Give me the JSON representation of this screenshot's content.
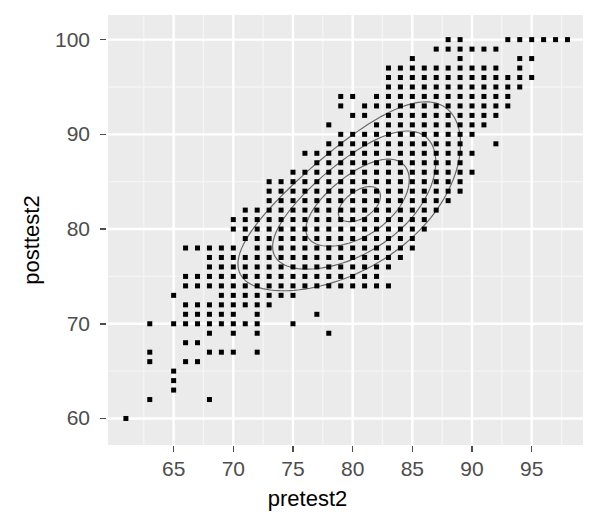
{
  "chart_data": {
    "type": "scatter",
    "title": "",
    "subtitle": "",
    "xlabel": "pretest2",
    "ylabel": "posttest2",
    "xlim": [
      59.5,
      99.3
    ],
    "ylim": [
      57.2,
      102.6
    ],
    "xticks": [
      65,
      70,
      75,
      80,
      85,
      90,
      95
    ],
    "yticks": [
      60,
      70,
      80,
      90,
      100
    ],
    "grid": true,
    "legend": null,
    "theme": "ggplot2-gray",
    "colors": {
      "panel_background": "#ebebeb",
      "grid_major": "#ffffff",
      "grid_minor": "#f5f5f5",
      "point_fill": "#000000",
      "contour_line": "#666666",
      "axis_text": "#4d4d4d",
      "axis_title": "#000000",
      "figure_background": "#ffffff"
    },
    "point_marker": {
      "shape": "square",
      "size_px": 5
    },
    "annotations": [],
    "overlays": [
      {
        "name": "density-2d-contours",
        "type": "contour",
        "levels": 4,
        "color": "#666666",
        "description": "Nested elongated elliptical 2D kernel-density contours oriented along the positive diagonal, centred near (80.5, 82.5)."
      }
    ],
    "points": [
      [
        61,
        60
      ],
      [
        63,
        62
      ],
      [
        63,
        66
      ],
      [
        63,
        67
      ],
      [
        63,
        70
      ],
      [
        65,
        63
      ],
      [
        65,
        64
      ],
      [
        65,
        65
      ],
      [
        65,
        70
      ],
      [
        65,
        73
      ],
      [
        66,
        66
      ],
      [
        66,
        68
      ],
      [
        66,
        70
      ],
      [
        66,
        71
      ],
      [
        66,
        72
      ],
      [
        66,
        74
      ],
      [
        66,
        75
      ],
      [
        66,
        78
      ],
      [
        67,
        66
      ],
      [
        67,
        68
      ],
      [
        67,
        70
      ],
      [
        67,
        71
      ],
      [
        67,
        72
      ],
      [
        67,
        74
      ],
      [
        67,
        75
      ],
      [
        67,
        78
      ],
      [
        68,
        62
      ],
      [
        68,
        67
      ],
      [
        68,
        69
      ],
      [
        68,
        70
      ],
      [
        68,
        71
      ],
      [
        68,
        72
      ],
      [
        68,
        74
      ],
      [
        68,
        75
      ],
      [
        68,
        76
      ],
      [
        68,
        77
      ],
      [
        68,
        78
      ],
      [
        69,
        67
      ],
      [
        69,
        70
      ],
      [
        69,
        71
      ],
      [
        69,
        72
      ],
      [
        69,
        73
      ],
      [
        69,
        74
      ],
      [
        69,
        75
      ],
      [
        69,
        76
      ],
      [
        69,
        77
      ],
      [
        69,
        78
      ],
      [
        70,
        67
      ],
      [
        70,
        69
      ],
      [
        70,
        70
      ],
      [
        70,
        71
      ],
      [
        70,
        72
      ],
      [
        70,
        73
      ],
      [
        70,
        74
      ],
      [
        70,
        75
      ],
      [
        70,
        76
      ],
      [
        70,
        77
      ],
      [
        70,
        78
      ],
      [
        70,
        80
      ],
      [
        70,
        81
      ],
      [
        71,
        70
      ],
      [
        71,
        72
      ],
      [
        71,
        73
      ],
      [
        71,
        74
      ],
      [
        71,
        75
      ],
      [
        71,
        76
      ],
      [
        71,
        77
      ],
      [
        71,
        79
      ],
      [
        71,
        80
      ],
      [
        71,
        81
      ],
      [
        71,
        82
      ],
      [
        72,
        67
      ],
      [
        72,
        69
      ],
      [
        72,
        70
      ],
      [
        72,
        71
      ],
      [
        72,
        72
      ],
      [
        72,
        73
      ],
      [
        72,
        74
      ],
      [
        72,
        75
      ],
      [
        72,
        76
      ],
      [
        72,
        77
      ],
      [
        72,
        78
      ],
      [
        72,
        79
      ],
      [
        72,
        80
      ],
      [
        72,
        81
      ],
      [
        72,
        82
      ],
      [
        73,
        72
      ],
      [
        73,
        73
      ],
      [
        73,
        74
      ],
      [
        73,
        75
      ],
      [
        73,
        76
      ],
      [
        73,
        77
      ],
      [
        73,
        78
      ],
      [
        73,
        79
      ],
      [
        73,
        80
      ],
      [
        73,
        81
      ],
      [
        73,
        82
      ],
      [
        73,
        83
      ],
      [
        73,
        84
      ],
      [
        73,
        85
      ],
      [
        74,
        73
      ],
      [
        74,
        74
      ],
      [
        74,
        75
      ],
      [
        74,
        76
      ],
      [
        74,
        77
      ],
      [
        74,
        78
      ],
      [
        74,
        79
      ],
      [
        74,
        80
      ],
      [
        74,
        81
      ],
      [
        74,
        82
      ],
      [
        74,
        83
      ],
      [
        74,
        84
      ],
      [
        74,
        85
      ],
      [
        75,
        70
      ],
      [
        75,
        73
      ],
      [
        75,
        74
      ],
      [
        75,
        75
      ],
      [
        75,
        76
      ],
      [
        75,
        77
      ],
      [
        75,
        78
      ],
      [
        75,
        79
      ],
      [
        75,
        80
      ],
      [
        75,
        81
      ],
      [
        75,
        82
      ],
      [
        75,
        83
      ],
      [
        75,
        84
      ],
      [
        75,
        85
      ],
      [
        75,
        86
      ],
      [
        76,
        74
      ],
      [
        76,
        75
      ],
      [
        76,
        76
      ],
      [
        76,
        77
      ],
      [
        76,
        78
      ],
      [
        76,
        79
      ],
      [
        76,
        80
      ],
      [
        76,
        81
      ],
      [
        76,
        82
      ],
      [
        76,
        83
      ],
      [
        76,
        84
      ],
      [
        76,
        85
      ],
      [
        76,
        86
      ],
      [
        76,
        88
      ],
      [
        77,
        71
      ],
      [
        77,
        74
      ],
      [
        77,
        75
      ],
      [
        77,
        76
      ],
      [
        77,
        77
      ],
      [
        77,
        78
      ],
      [
        77,
        79
      ],
      [
        77,
        80
      ],
      [
        77,
        81
      ],
      [
        77,
        82
      ],
      [
        77,
        83
      ],
      [
        77,
        84
      ],
      [
        77,
        85
      ],
      [
        77,
        86
      ],
      [
        77,
        87
      ],
      [
        77,
        88
      ],
      [
        78,
        69
      ],
      [
        78,
        74
      ],
      [
        78,
        75
      ],
      [
        78,
        76
      ],
      [
        78,
        77
      ],
      [
        78,
        78
      ],
      [
        78,
        79
      ],
      [
        78,
        80
      ],
      [
        78,
        81
      ],
      [
        78,
        82
      ],
      [
        78,
        83
      ],
      [
        78,
        84
      ],
      [
        78,
        85
      ],
      [
        78,
        86
      ],
      [
        78,
        87
      ],
      [
        78,
        88
      ],
      [
        78,
        89
      ],
      [
        78,
        91
      ],
      [
        79,
        74
      ],
      [
        79,
        75
      ],
      [
        79,
        76
      ],
      [
        79,
        77
      ],
      [
        79,
        78
      ],
      [
        79,
        79
      ],
      [
        79,
        80
      ],
      [
        79,
        81
      ],
      [
        79,
        82
      ],
      [
        79,
        83
      ],
      [
        79,
        84
      ],
      [
        79,
        85
      ],
      [
        79,
        86
      ],
      [
        79,
        87
      ],
      [
        79,
        88
      ],
      [
        79,
        89
      ],
      [
        79,
        90
      ],
      [
        79,
        93
      ],
      [
        79,
        94
      ],
      [
        80,
        74
      ],
      [
        80,
        75
      ],
      [
        80,
        76
      ],
      [
        80,
        77
      ],
      [
        80,
        78
      ],
      [
        80,
        79
      ],
      [
        80,
        80
      ],
      [
        80,
        81
      ],
      [
        80,
        82
      ],
      [
        80,
        83
      ],
      [
        80,
        84
      ],
      [
        80,
        85
      ],
      [
        80,
        86
      ],
      [
        80,
        87
      ],
      [
        80,
        88
      ],
      [
        80,
        89
      ],
      [
        80,
        90
      ],
      [
        80,
        92
      ],
      [
        80,
        94
      ],
      [
        81,
        74
      ],
      [
        81,
        75
      ],
      [
        81,
        76
      ],
      [
        81,
        77
      ],
      [
        81,
        78
      ],
      [
        81,
        79
      ],
      [
        81,
        80
      ],
      [
        81,
        81
      ],
      [
        81,
        82
      ],
      [
        81,
        83
      ],
      [
        81,
        84
      ],
      [
        81,
        85
      ],
      [
        81,
        86
      ],
      [
        81,
        87
      ],
      [
        81,
        88
      ],
      [
        81,
        89
      ],
      [
        81,
        90
      ],
      [
        81,
        92
      ],
      [
        81,
        93
      ],
      [
        82,
        74
      ],
      [
        82,
        75
      ],
      [
        82,
        76
      ],
      [
        82,
        77
      ],
      [
        82,
        78
      ],
      [
        82,
        79
      ],
      [
        82,
        80
      ],
      [
        82,
        81
      ],
      [
        82,
        82
      ],
      [
        82,
        83
      ],
      [
        82,
        84
      ],
      [
        82,
        85
      ],
      [
        82,
        86
      ],
      [
        82,
        87
      ],
      [
        82,
        88
      ],
      [
        82,
        89
      ],
      [
        82,
        90
      ],
      [
        82,
        91
      ],
      [
        82,
        93
      ],
      [
        82,
        94
      ],
      [
        83,
        74
      ],
      [
        83,
        76
      ],
      [
        83,
        77
      ],
      [
        83,
        78
      ],
      [
        83,
        79
      ],
      [
        83,
        80
      ],
      [
        83,
        81
      ],
      [
        83,
        82
      ],
      [
        83,
        83
      ],
      [
        83,
        84
      ],
      [
        83,
        85
      ],
      [
        83,
        86
      ],
      [
        83,
        87
      ],
      [
        83,
        88
      ],
      [
        83,
        89
      ],
      [
        83,
        90
      ],
      [
        83,
        91
      ],
      [
        83,
        92
      ],
      [
        83,
        93
      ],
      [
        83,
        94
      ],
      [
        83,
        95
      ],
      [
        83,
        96
      ],
      [
        83,
        97
      ],
      [
        84,
        77
      ],
      [
        84,
        78
      ],
      [
        84,
        79
      ],
      [
        84,
        80
      ],
      [
        84,
        81
      ],
      [
        84,
        82
      ],
      [
        84,
        83
      ],
      [
        84,
        84
      ],
      [
        84,
        85
      ],
      [
        84,
        86
      ],
      [
        84,
        87
      ],
      [
        84,
        88
      ],
      [
        84,
        89
      ],
      [
        84,
        90
      ],
      [
        84,
        91
      ],
      [
        84,
        92
      ],
      [
        84,
        93
      ],
      [
        84,
        94
      ],
      [
        84,
        95
      ],
      [
        84,
        96
      ],
      [
        84,
        97
      ],
      [
        85,
        78
      ],
      [
        85,
        79
      ],
      [
        85,
        80
      ],
      [
        85,
        81
      ],
      [
        85,
        82
      ],
      [
        85,
        83
      ],
      [
        85,
        84
      ],
      [
        85,
        85
      ],
      [
        85,
        86
      ],
      [
        85,
        87
      ],
      [
        85,
        88
      ],
      [
        85,
        89
      ],
      [
        85,
        90
      ],
      [
        85,
        91
      ],
      [
        85,
        92
      ],
      [
        85,
        93
      ],
      [
        85,
        94
      ],
      [
        85,
        95
      ],
      [
        85,
        96
      ],
      [
        85,
        97
      ],
      [
        85,
        98
      ],
      [
        86,
        80
      ],
      [
        86,
        81
      ],
      [
        86,
        82
      ],
      [
        86,
        83
      ],
      [
        86,
        84
      ],
      [
        86,
        85
      ],
      [
        86,
        86
      ],
      [
        86,
        87
      ],
      [
        86,
        88
      ],
      [
        86,
        89
      ],
      [
        86,
        90
      ],
      [
        86,
        91
      ],
      [
        86,
        92
      ],
      [
        86,
        93
      ],
      [
        86,
        94
      ],
      [
        86,
        95
      ],
      [
        86,
        96
      ],
      [
        86,
        97
      ],
      [
        87,
        82
      ],
      [
        87,
        83
      ],
      [
        87,
        84
      ],
      [
        87,
        85
      ],
      [
        87,
        86
      ],
      [
        87,
        87
      ],
      [
        87,
        88
      ],
      [
        87,
        89
      ],
      [
        87,
        90
      ],
      [
        87,
        91
      ],
      [
        87,
        92
      ],
      [
        87,
        93
      ],
      [
        87,
        94
      ],
      [
        87,
        95
      ],
      [
        87,
        96
      ],
      [
        87,
        97
      ],
      [
        87,
        99
      ],
      [
        88,
        83
      ],
      [
        88,
        84
      ],
      [
        88,
        85
      ],
      [
        88,
        86
      ],
      [
        88,
        87
      ],
      [
        88,
        88
      ],
      [
        88,
        89
      ],
      [
        88,
        90
      ],
      [
        88,
        91
      ],
      [
        88,
        92
      ],
      [
        88,
        93
      ],
      [
        88,
        94
      ],
      [
        88,
        95
      ],
      [
        88,
        96
      ],
      [
        88,
        97
      ],
      [
        88,
        99
      ],
      [
        88,
        100
      ],
      [
        89,
        84
      ],
      [
        89,
        85
      ],
      [
        89,
        86
      ],
      [
        89,
        87
      ],
      [
        89,
        88
      ],
      [
        89,
        89
      ],
      [
        89,
        90
      ],
      [
        89,
        91
      ],
      [
        89,
        92
      ],
      [
        89,
        93
      ],
      [
        89,
        94
      ],
      [
        89,
        95
      ],
      [
        89,
        96
      ],
      [
        89,
        97
      ],
      [
        89,
        98
      ],
      [
        89,
        99
      ],
      [
        89,
        100
      ],
      [
        90,
        86
      ],
      [
        90,
        88
      ],
      [
        90,
        90
      ],
      [
        90,
        91
      ],
      [
        90,
        92
      ],
      [
        90,
        93
      ],
      [
        90,
        94
      ],
      [
        90,
        95
      ],
      [
        90,
        96
      ],
      [
        90,
        97
      ],
      [
        90,
        99
      ],
      [
        91,
        91
      ],
      [
        91,
        92
      ],
      [
        91,
        93
      ],
      [
        91,
        94
      ],
      [
        91,
        95
      ],
      [
        91,
        96
      ],
      [
        91,
        97
      ],
      [
        91,
        99
      ],
      [
        92,
        89
      ],
      [
        92,
        92
      ],
      [
        92,
        93
      ],
      [
        92,
        94
      ],
      [
        92,
        95
      ],
      [
        92,
        96
      ],
      [
        92,
        97
      ],
      [
        92,
        99
      ],
      [
        93,
        93
      ],
      [
        93,
        94
      ],
      [
        93,
        95
      ],
      [
        93,
        96
      ],
      [
        93,
        100
      ],
      [
        94,
        95
      ],
      [
        94,
        96
      ],
      [
        94,
        97
      ],
      [
        94,
        98
      ],
      [
        94,
        100
      ],
      [
        95,
        96
      ],
      [
        95,
        98
      ],
      [
        95,
        100
      ],
      [
        96,
        100
      ],
      [
        97,
        100
      ],
      [
        98,
        100
      ]
    ]
  },
  "axes": {
    "x": {
      "title": "pretest2",
      "ticks": [
        "65",
        "70",
        "75",
        "80",
        "85",
        "90",
        "95"
      ]
    },
    "y": {
      "title": "posttest2",
      "ticks": [
        "100",
        "90",
        "80",
        "70",
        "60"
      ]
    }
  }
}
